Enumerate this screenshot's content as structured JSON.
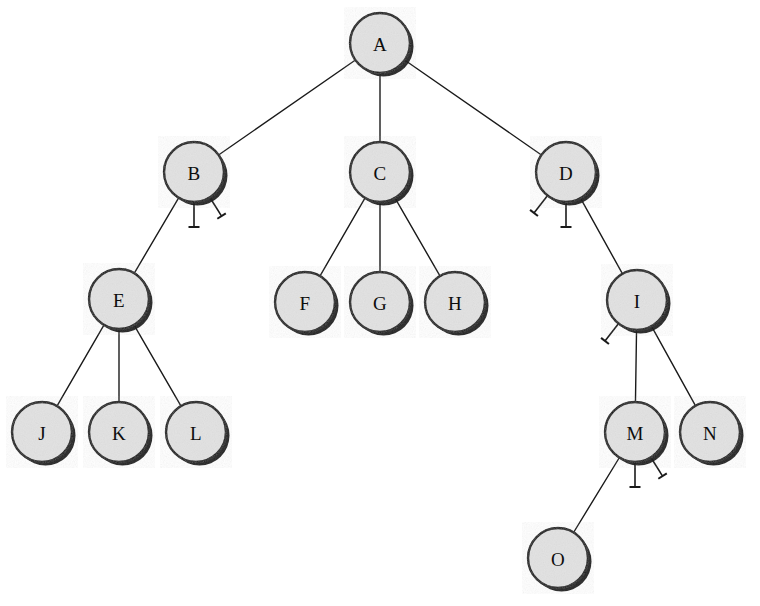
{
  "diagram": {
    "type": "node-link-tree",
    "canvas": {
      "width": 760,
      "height": 606
    },
    "style": {
      "node_fill": "#e2e2e2",
      "node_stroke": "#111111",
      "node_shadow": "#111111",
      "edge_color": "#1a1a1a",
      "label_color": "#0d0d0d",
      "background": "#ffffff",
      "node_radius": 30,
      "edge_width": 1.4,
      "node_stroke_width": 2.4
    },
    "nodes": [
      {
        "id": "A",
        "label": "A",
        "x": 380,
        "y": 43,
        "depth": 0
      },
      {
        "id": "B",
        "label": "B",
        "x": 194,
        "y": 172,
        "depth": 1
      },
      {
        "id": "C",
        "label": "C",
        "x": 380,
        "y": 172,
        "depth": 1
      },
      {
        "id": "D",
        "label": "D",
        "x": 566,
        "y": 172,
        "depth": 1
      },
      {
        "id": "E",
        "label": "E",
        "x": 119,
        "y": 299,
        "depth": 2
      },
      {
        "id": "F",
        "label": "F",
        "x": 305,
        "y": 302,
        "depth": 2
      },
      {
        "id": "G",
        "label": "G",
        "x": 380,
        "y": 302,
        "depth": 2
      },
      {
        "id": "H",
        "label": "H",
        "x": 455,
        "y": 302,
        "depth": 2
      },
      {
        "id": "I",
        "label": "I",
        "x": 637,
        "y": 300,
        "depth": 2
      },
      {
        "id": "J",
        "label": "J",
        "x": 42,
        "y": 432,
        "depth": 3
      },
      {
        "id": "K",
        "label": "K",
        "x": 119,
        "y": 432,
        "depth": 3
      },
      {
        "id": "L",
        "label": "L",
        "x": 196,
        "y": 432,
        "depth": 3
      },
      {
        "id": "M",
        "label": "M",
        "x": 635,
        "y": 432,
        "depth": 3
      },
      {
        "id": "N",
        "label": "N",
        "x": 710,
        "y": 432,
        "depth": 3
      },
      {
        "id": "O",
        "label": "O",
        "x": 558,
        "y": 558,
        "depth": 4
      }
    ],
    "edges": [
      {
        "from": "A",
        "to": "B"
      },
      {
        "from": "A",
        "to": "C"
      },
      {
        "from": "A",
        "to": "D"
      },
      {
        "from": "B",
        "to": "E"
      },
      {
        "from": "C",
        "to": "F"
      },
      {
        "from": "C",
        "to": "G"
      },
      {
        "from": "C",
        "to": "H"
      },
      {
        "from": "D",
        "to": "I"
      },
      {
        "from": "E",
        "to": "J"
      },
      {
        "from": "E",
        "to": "K"
      },
      {
        "from": "E",
        "to": "L"
      },
      {
        "from": "I",
        "to": "M"
      },
      {
        "from": "I",
        "to": "N"
      },
      {
        "from": "M",
        "to": "O"
      }
    ],
    "null_markers": [
      {
        "parent": "B",
        "angle_deg": 90,
        "length": 27,
        "bar": 11,
        "shape": "perpendicular-bar"
      },
      {
        "parent": "B",
        "angle_deg": 58,
        "length": 24,
        "bar": 10,
        "shape": "perpendicular-bar"
      },
      {
        "parent": "D",
        "angle_deg": 128,
        "length": 24,
        "bar": 10,
        "shape": "perpendicular-bar"
      },
      {
        "parent": "D",
        "angle_deg": 90,
        "length": 27,
        "bar": 11,
        "shape": "perpendicular-bar"
      },
      {
        "parent": "I",
        "angle_deg": 128,
        "length": 24,
        "bar": 10,
        "shape": "perpendicular-bar"
      },
      {
        "parent": "M",
        "angle_deg": 90,
        "length": 27,
        "bar": 11,
        "shape": "perpendicular-bar"
      },
      {
        "parent": "M",
        "angle_deg": 58,
        "length": 24,
        "bar": 10,
        "shape": "perpendicular-bar"
      }
    ]
  }
}
